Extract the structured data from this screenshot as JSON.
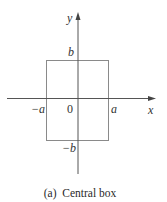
{
  "figure": {
    "caption": "(a)  Central box",
    "axes": {
      "x_label": "x",
      "y_label": "y"
    },
    "ticks": {
      "neg_a": "−a",
      "origin": "0",
      "pos_a": "a",
      "pos_b": "b",
      "neg_b": "−b"
    },
    "region": {
      "name": "central box",
      "x_range": [
        "-a",
        "a"
      ],
      "y_range": [
        "-b",
        "b"
      ]
    },
    "colors": {
      "axis": "#555555",
      "box": "#888888",
      "text": "#333333"
    }
  }
}
